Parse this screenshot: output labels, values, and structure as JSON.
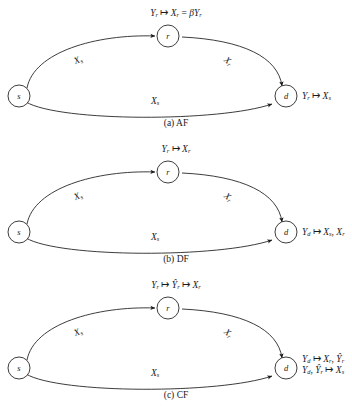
{
  "figure": {
    "type": "relay-channel-protocol-diagrams",
    "node_labels": {
      "source": "s",
      "relay": "r",
      "destination": "d"
    },
    "panels": [
      {
        "id": "a",
        "caption": "(a) AF",
        "relay_mapping": "Yᵣ ↦ Xᵣ = βYᵣ",
        "relay_mapping_parts": {
          "input": "Y",
          "input_sub": "r",
          "arrow": "↦",
          "output": "X",
          "output_sub": "r",
          "equals": "=",
          "expression_coeff": "β",
          "expression_var": "Y",
          "expression_var_sub": "r"
        },
        "edge_sr_label": "X",
        "edge_sr_sub": "s",
        "edge_rd_label": "X",
        "edge_rd_sub": "r",
        "edge_sd_label": "X",
        "edge_sd_sub": "s",
        "destination_lines": [
          "Yᵣ ↦ Xₛ"
        ],
        "destination_parts": [
          {
            "v1": "Y",
            "s1": "r",
            "arrow": "↦",
            "v2": "X",
            "s2": "s"
          }
        ]
      },
      {
        "id": "b",
        "caption": "(b) DF",
        "relay_mapping": "Yᵣ ↦ Xᵣ",
        "relay_mapping_parts": {
          "input": "Y",
          "input_sub": "r",
          "arrow": "↦",
          "output": "X",
          "output_sub": "r"
        },
        "edge_sr_label": "X",
        "edge_sr_sub": "s",
        "edge_rd_label": "X",
        "edge_rd_sub": "r",
        "edge_sd_label": "X",
        "edge_sd_sub": "s",
        "destination_lines": [
          "Y_d ↦ X_s, X_r"
        ],
        "destination_parts": [
          {
            "v1": "Y",
            "s1": "d",
            "arrow": "↦",
            "v2": "X",
            "s2": "s",
            "sep": ",",
            "v3": "X",
            "s3": "r"
          }
        ]
      },
      {
        "id": "c",
        "caption": "(c) CF",
        "relay_mapping": "Yᵣ ↦ Ŷᵣ ↦ Xᵣ",
        "relay_mapping_parts": {
          "input": "Y",
          "input_sub": "r",
          "arrow1": "↦",
          "mid": "Y",
          "mid_sub": "r",
          "mid_hat": true,
          "arrow2": "↦",
          "output": "X",
          "output_sub": "r"
        },
        "edge_sr_label": "X",
        "edge_sr_sub": "s",
        "edge_rd_label": "X",
        "edge_rd_sub": "r",
        "edge_sd_label": "X",
        "edge_sd_sub": "s",
        "destination_lines": [
          "Y_d ↦ X_r, Ŷ_r",
          "Y_d, Ŷ_r ↦ X_s"
        ],
        "destination_parts": [
          {
            "v1": "Y",
            "s1": "d",
            "arrow": "↦",
            "v2": "X",
            "s2": "r",
            "sep": ",",
            "v3": "Y",
            "s3": "r",
            "v3_hat": true
          },
          {
            "v1": "Y",
            "s1": "d",
            "sep0": ",",
            "v1b": "Y",
            "s1b": "r",
            "v1b_hat": true,
            "arrow": "↦",
            "v2": "X",
            "s2": "s"
          }
        ]
      }
    ],
    "colors": {
      "stroke": "#1a1a1a",
      "background": "#ffffff",
      "text": "#1a1a1a"
    }
  }
}
